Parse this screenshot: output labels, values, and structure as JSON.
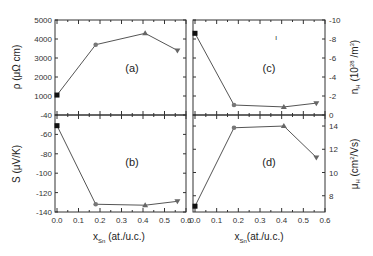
{
  "figure": {
    "x_axis_label_main": "x",
    "x_axis_label_sub": "Sn",
    "x_axis_label_unit": " (at./u.c.)",
    "x_axis_label_unit_right": "(at./u.c.)"
  },
  "chart_data": [
    {
      "type": "line",
      "panel": "(a)",
      "ylabel": "ρ (μΩ cm)",
      "xlabel": "x_Sn (at./u.c.)",
      "x": [
        0.0,
        0.18,
        0.41,
        0.56
      ],
      "values": [
        1050,
        3700,
        4300,
        3400
      ],
      "markers": [
        "square",
        "circle",
        "triangle-up",
        "triangle-down"
      ],
      "ylim": [
        0,
        5000
      ],
      "yticks": [
        "1000",
        "2000",
        "3000",
        "4000",
        "5000"
      ],
      "xlim": [
        0,
        0.6
      ],
      "axis_side": "left"
    },
    {
      "type": "line",
      "panel": "(b)",
      "ylabel": "S (μV/K)",
      "xlabel": "x_Sn (at./u.c.)",
      "x": [
        0.0,
        0.18,
        0.41,
        0.56
      ],
      "values": [
        -51,
        -132,
        -133,
        -129
      ],
      "markers": [
        "square",
        "circle",
        "triangle-up",
        "triangle-down"
      ],
      "ylim": [
        -140,
        -40
      ],
      "yticks": [
        "-40",
        "-60",
        "-80",
        "-100",
        "-120",
        "-140"
      ],
      "xlim": [
        0,
        0.6
      ],
      "xticks": [
        "0.0",
        "0.1",
        "0.2",
        "0.3",
        "0.4",
        "0.5",
        "0.6"
      ],
      "axis_side": "left"
    },
    {
      "type": "line",
      "panel": "(c)",
      "ylabel": "n_H (10^28 /m^3)",
      "xlabel": "x_Sn (at./u.c.)",
      "x": [
        0.0,
        0.18,
        0.41,
        0.56
      ],
      "values": [
        -8.6,
        -1.05,
        -0.85,
        -1.25
      ],
      "markers": [
        "square",
        "circle",
        "triangle-up",
        "triangle-down"
      ],
      "ylim": [
        0,
        -10
      ],
      "yticks": [
        "-10",
        "-8",
        "-6",
        "-4",
        "-2",
        "0"
      ],
      "xlim": [
        0,
        0.6
      ],
      "axis_side": "right",
      "annotation": "ı"
    },
    {
      "type": "line",
      "panel": "(d)",
      "ylabel": "μ_H (cm^2/Vs)",
      "xlabel": "x_Sn (at./u.c.)",
      "x": [
        0.0,
        0.18,
        0.41,
        0.56
      ],
      "values": [
        7.1,
        13.85,
        14.0,
        11.3
      ],
      "markers": [
        "square",
        "circle",
        "triangle-up",
        "triangle-down"
      ],
      "ylim": [
        6.6,
        14.95
      ],
      "yticks": [
        "8",
        "10",
        "12",
        "14"
      ],
      "xlim": [
        0,
        0.6
      ],
      "xticks": [
        "0.0",
        "0.1",
        "0.2",
        "0.3",
        "0.4",
        "0.5",
        "0.6"
      ],
      "axis_side": "right"
    }
  ]
}
